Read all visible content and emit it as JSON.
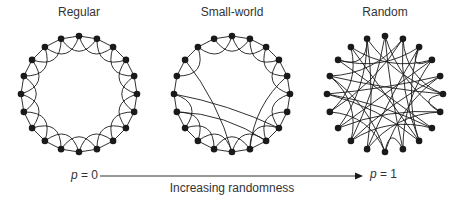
{
  "panels": [
    {
      "title": "Regular",
      "cx": 79,
      "cy": 94,
      "r": 58,
      "nodes": 20,
      "type": "regular"
    },
    {
      "title": "Small-world",
      "cx": 232,
      "cy": 94,
      "r": 58,
      "nodes": 20,
      "type": "small-world",
      "rewired": [
        [
          15,
          7
        ],
        [
          14,
          8
        ],
        [
          17,
          10
        ],
        [
          4,
          9
        ]
      ]
    },
    {
      "title": "Random",
      "cx": 385,
      "cy": 94,
      "r": 58,
      "nodes": 20,
      "type": "random",
      "edges": [
        [
          0,
          9
        ],
        [
          0,
          12
        ],
        [
          1,
          8
        ],
        [
          1,
          14
        ],
        [
          1,
          16
        ],
        [
          2,
          3
        ],
        [
          2,
          11
        ],
        [
          2,
          17
        ],
        [
          3,
          13
        ],
        [
          3,
          18
        ],
        [
          4,
          12
        ],
        [
          4,
          15
        ],
        [
          5,
          6
        ],
        [
          5,
          16
        ],
        [
          5,
          19
        ],
        [
          6,
          13
        ],
        [
          7,
          17
        ],
        [
          7,
          15
        ],
        [
          8,
          18
        ],
        [
          9,
          10
        ],
        [
          10,
          14
        ],
        [
          11,
          19
        ],
        [
          12,
          16
        ],
        [
          13,
          19
        ],
        [
          0,
          6
        ],
        [
          3,
          9
        ],
        [
          4,
          10
        ],
        [
          6,
          11
        ],
        [
          8,
          15
        ],
        [
          14,
          18
        ],
        [
          17,
          19
        ],
        [
          7,
          12
        ],
        [
          10,
          16
        ],
        [
          1,
          5
        ],
        [
          2,
          8
        ]
      ]
    }
  ],
  "axis": {
    "left_label_var": "p",
    "left_label_val": " = 0",
    "right_label_var": "p",
    "right_label_val": " = 1",
    "caption": "Increasing randomness"
  },
  "colors": {
    "ink": "#1a1a1a",
    "text": "#333333"
  }
}
